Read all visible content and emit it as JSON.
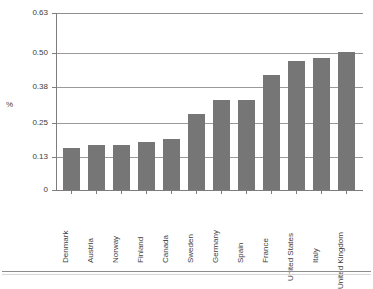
{
  "chart_data": {
    "type": "bar",
    "title": "",
    "subtitle": "",
    "xlabel": "",
    "ylabel": "%",
    "categories": [
      "Denmark",
      "Austria",
      "Norway",
      "Finland",
      "Canada",
      "Sweden",
      "Germany",
      "Spain",
      "France",
      "United States",
      "Italy",
      "United Kingdom"
    ],
    "values": [
      0.15,
      0.16,
      0.16,
      0.17,
      0.18,
      0.27,
      0.32,
      0.32,
      0.41,
      0.46,
      0.47,
      0.49
    ],
    "ylim": [
      0,
      0.63
    ],
    "ytick_labels": [
      "0.63",
      "0.50",
      "0.38",
      "0.25",
      "0.13",
      "0"
    ],
    "ytick_values": [
      0.63,
      0.5,
      0.38,
      0.25,
      0.13,
      0
    ],
    "grid": true,
    "grid_axis": "y",
    "legend": null,
    "legend_position": "none",
    "bar_color": "#767676",
    "axis_color": "#7d7d7d",
    "grid_color": "#9a9a9a",
    "text_color": "#3d3d3d",
    "background_color": "#ffffff"
  },
  "figure": {
    "y_axis_title": "%",
    "bottom_rule": true
  }
}
